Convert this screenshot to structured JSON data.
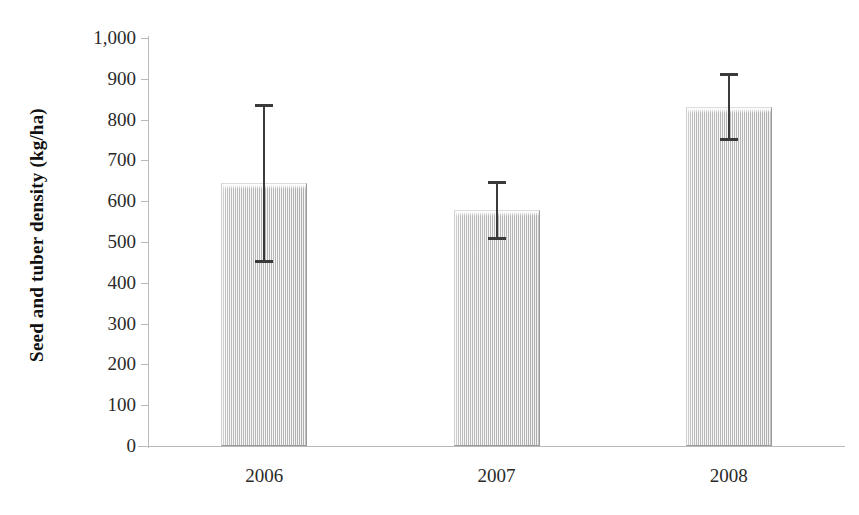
{
  "chart_data": {
    "type": "bar",
    "title": "",
    "xlabel": "",
    "ylabel": "Seed and tuber density (kg/ha)",
    "categories": [
      "2006",
      "2007",
      "2008"
    ],
    "values": [
      645,
      578,
      830
    ],
    "errors_upper": [
      838,
      650,
      914
    ],
    "errors_lower": [
      452,
      507,
      750
    ],
    "error_plus": [
      193,
      72,
      84
    ],
    "error_minus": [
      193,
      71,
      80
    ],
    "ylim": [
      0,
      1000
    ],
    "ytick_step": 100,
    "ytick_labels": [
      "0",
      "100",
      "200",
      "300",
      "400",
      "500",
      "600",
      "700",
      "800",
      "900",
      "1,000"
    ],
    "ytick_values": [
      0,
      100,
      200,
      300,
      400,
      500,
      600,
      700,
      800,
      900,
      1000
    ],
    "grid": false,
    "legend": null,
    "legend_position": "none",
    "bar_fill": "#c9c9c9",
    "bar_border": "#9a9a9a",
    "errorbar_color": "#3a3a3a",
    "axis_color": "#b9b9b9",
    "text_color": "#2a2a2a",
    "background": "#ffffff",
    "annotations": []
  }
}
